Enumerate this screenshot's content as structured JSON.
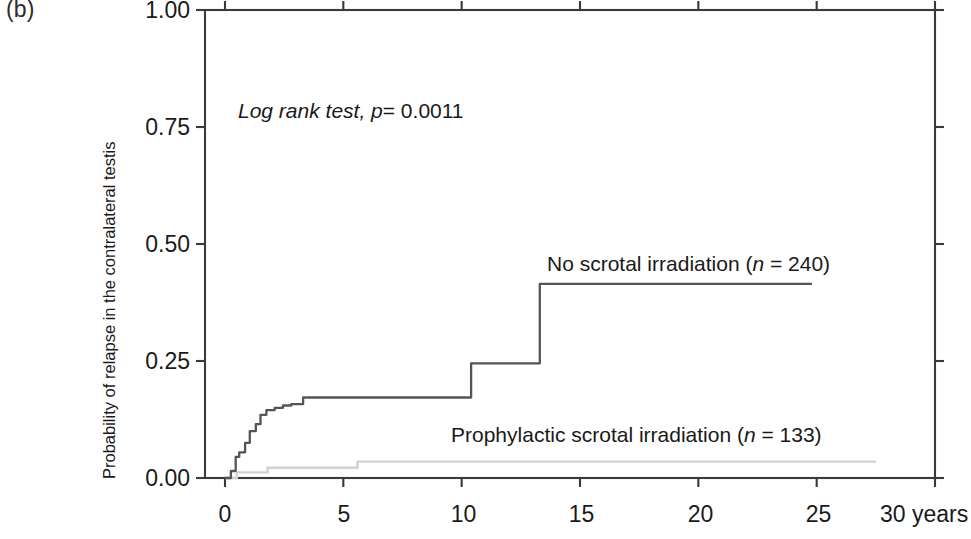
{
  "panel": {
    "label": "(b)"
  },
  "annotations": {
    "logrank_italic": "Log rank test, p",
    "logrank_value": "= 0.0011",
    "logrank_full": "Log rank test, p = 0.0011"
  },
  "axes": {
    "y_title": "Probability of relapse in the contralateral testis",
    "y_ticks": [
      "0.00",
      "0.25",
      "0.50",
      "0.75",
      "1.00"
    ],
    "x_ticks": [
      "0",
      "5",
      "10",
      "15",
      "20",
      "25",
      "30 years"
    ],
    "x_unit": "years"
  },
  "series_labels": {
    "no_scrotal_main": "No scrotal irradiation (",
    "no_scrotal_n": "n",
    "no_scrotal_tail": " = 240)",
    "prophylactic_main": "Prophylactic scrotal irradiation (",
    "prophylactic_n": "n",
    "prophylactic_tail": " = 133)"
  },
  "colors": {
    "axis": "#3a3a3a",
    "curve_no_scrotal": "#555555",
    "curve_prophylactic": "#d2d2d2",
    "text": "#1a1a1a",
    "background": "#ffffff"
  },
  "chart_data": {
    "type": "line",
    "subtype": "kaplan-meier-step",
    "title": "",
    "xlabel": "years",
    "ylabel": "Probability of relapse in the contralateral testis",
    "xlim": [
      0,
      30
    ],
    "ylim": [
      0.0,
      1.0
    ],
    "xticks": [
      0,
      5,
      10,
      15,
      20,
      25,
      30
    ],
    "yticks": [
      0.0,
      0.25,
      0.5,
      0.75,
      1.0
    ],
    "grid": false,
    "legend": "inline-annotation",
    "annotation": "Log rank test, p = 0.0011",
    "p_value": 0.0011,
    "series": [
      {
        "name": "No scrotal irradiation (n = 240)",
        "n": 240,
        "color": "#555555",
        "x_end": 24.8,
        "final_value": 0.415,
        "points": [
          [
            0.0,
            0.0
          ],
          [
            0.25,
            0.015
          ],
          [
            0.45,
            0.045
          ],
          [
            0.6,
            0.055
          ],
          [
            0.85,
            0.075
          ],
          [
            1.05,
            0.1
          ],
          [
            1.3,
            0.115
          ],
          [
            1.5,
            0.135
          ],
          [
            1.75,
            0.145
          ],
          [
            2.1,
            0.15
          ],
          [
            2.45,
            0.155
          ],
          [
            2.8,
            0.158
          ],
          [
            3.3,
            0.172
          ],
          [
            10.35,
            0.172
          ],
          [
            10.4,
            0.245
          ],
          [
            13.2,
            0.245
          ],
          [
            13.3,
            0.415
          ],
          [
            24.8,
            0.415
          ]
        ]
      },
      {
        "name": "Prophylactic scrotal irradiation (n = 133)",
        "n": 133,
        "color": "#d2d2d2",
        "x_end": 27.5,
        "final_value": 0.035,
        "points": [
          [
            0.0,
            0.0
          ],
          [
            0.45,
            0.0
          ],
          [
            0.5,
            0.012
          ],
          [
            1.75,
            0.012
          ],
          [
            1.8,
            0.022
          ],
          [
            5.5,
            0.022
          ],
          [
            5.6,
            0.035
          ],
          [
            27.5,
            0.035
          ]
        ]
      }
    ]
  }
}
